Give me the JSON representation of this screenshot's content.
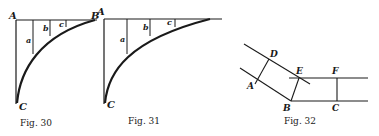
{
  "figures": [
    {
      "id": "fig30",
      "caption": "Fig. 30",
      "labels": {
        "A": "A",
        "B": "B",
        "C": "C",
        "a": "a",
        "b": "b",
        "c": "c"
      }
    },
    {
      "id": "fig31",
      "caption": "Fig. 31",
      "labels": {
        "A": "A",
        "C": "C",
        "a": "a",
        "b": "b",
        "c": "c"
      }
    },
    {
      "id": "fig32",
      "caption": "Fig. 32",
      "labels": {
        "A": "A",
        "B": "B",
        "C": "C",
        "D": "D",
        "E": "E",
        "F": "F"
      }
    }
  ],
  "colors": {
    "ink": "#1a1a1a",
    "background": "#ffffff"
  }
}
